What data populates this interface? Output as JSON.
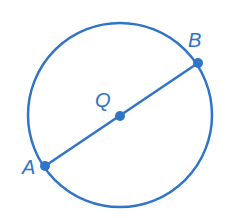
{
  "diagram": {
    "type": "circle-with-diameter",
    "color": "#2f74c8",
    "circle": {
      "cx": 120,
      "cy": 115,
      "r": 92
    },
    "points": [
      {
        "label": "A",
        "x": 45,
        "y": 166,
        "label_x": 22,
        "label_y": 174
      },
      {
        "label": "Q",
        "x": 120,
        "y": 116,
        "label_x": 95,
        "label_y": 107
      },
      {
        "label": "B",
        "x": 198,
        "y": 63,
        "label_x": 188,
        "label_y": 47
      }
    ],
    "segment": {
      "from": "A",
      "to": "B"
    }
  }
}
